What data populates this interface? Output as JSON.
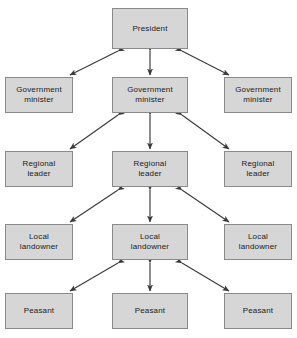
{
  "diagram": {
    "title_fragment": "",
    "type": "hierarchy-chart",
    "box_fill_color": "#d6d6d6",
    "box_border_color": "#8a8a8a",
    "arrow_color": "#3a3a3a",
    "background_color": "#ffffff",
    "columns": 3,
    "rows": 5,
    "levels": [
      {
        "level_name": "president",
        "nodes": [
          {
            "label": "President",
            "column": "center"
          }
        ]
      },
      {
        "level_name": "government-minister",
        "nodes": [
          {
            "label": "Government\nminister",
            "column": "left"
          },
          {
            "label": "Government\nminister",
            "column": "center"
          },
          {
            "label": "Government\nminister",
            "column": "right"
          }
        ]
      },
      {
        "level_name": "regional-leader",
        "nodes": [
          {
            "label": "Regional\nleader",
            "column": "left"
          },
          {
            "label": "Regional\nleader",
            "column": "center"
          },
          {
            "label": "Regional\nleader",
            "column": "right"
          }
        ]
      },
      {
        "level_name": "local-landowner",
        "nodes": [
          {
            "label": "Local\nlandowner",
            "column": "left"
          },
          {
            "label": "Local\nlandowner",
            "column": "center"
          },
          {
            "label": "Local\nlandowner",
            "column": "right"
          }
        ]
      },
      {
        "level_name": "peasant",
        "nodes": [
          {
            "label": "Peasant",
            "column": "left"
          },
          {
            "label": "Peasant",
            "column": "center"
          },
          {
            "label": "Peasant",
            "column": "right"
          }
        ]
      }
    ],
    "boxes": {
      "president_center": "President",
      "minister_left": "Government\nminister",
      "minister_center": "Government\nminister",
      "minister_right": "Government\nminister",
      "regional_left": "Regional\nleader",
      "regional_center": "Regional\nleader",
      "regional_right": "Regional\nleader",
      "landowner_left": "Local\nlandowner",
      "landowner_center": "Local\nlandowner",
      "landowner_right": "Local\nlandowner",
      "peasant_left": "Peasant",
      "peasant_center": "Peasant",
      "peasant_right": "Peasant"
    },
    "connections": {
      "style": "double-headed-arrow",
      "count": 12,
      "description": "Each centre-column node links bidirectionally to the node directly below it and diagonally to the left and right nodes of the row below."
    }
  }
}
